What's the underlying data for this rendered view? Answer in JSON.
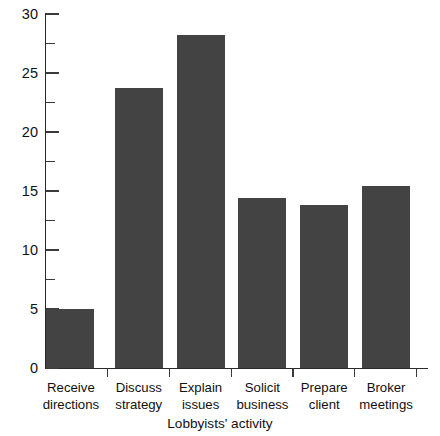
{
  "chart_data": {
    "type": "bar",
    "title": "",
    "xlabel": "Lobbyists' activity",
    "ylabel": "",
    "categories": [
      "Receive directions",
      "Discuss strategy",
      "Explain issues",
      "Solicit business",
      "Prepare client",
      "Broker meetings"
    ],
    "category_lines": [
      [
        "Receive",
        "directions"
      ],
      [
        "Discuss",
        "strategy"
      ],
      [
        "Explain",
        "issues"
      ],
      [
        "Solicit",
        "business"
      ],
      [
        "Prepare",
        "client"
      ],
      [
        "Broker",
        "meetings"
      ]
    ],
    "values": [
      5.0,
      23.7,
      28.2,
      14.4,
      13.8,
      15.4
    ],
    "ylim": [
      0,
      30
    ],
    "y_major_ticks": [
      0,
      5,
      10,
      15,
      20,
      25,
      30
    ],
    "y_minor_ticks": [
      2.5,
      7.5,
      12.5,
      17.5,
      22.5,
      27.5
    ],
    "y_tick_labels": [
      "0",
      "5",
      "10",
      "15",
      "20",
      "25",
      "30"
    ],
    "grid": false,
    "legend": false,
    "bar_color": "#434343",
    "axis_color": "#2b2b2b"
  }
}
